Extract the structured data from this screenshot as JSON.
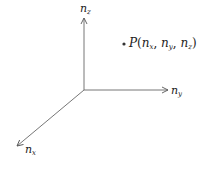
{
  "diagram": {
    "type": "3d-axes",
    "axes": {
      "z": {
        "base": "n",
        "sub": "z"
      },
      "y": {
        "base": "n",
        "sub": "y"
      },
      "x": {
        "base": "n",
        "sub": "x"
      }
    },
    "point": {
      "name": "P",
      "open": "(",
      "coords": [
        {
          "base": "n",
          "sub": "x"
        },
        {
          "base": "n",
          "sub": "y"
        },
        {
          "base": "n",
          "sub": "z"
        }
      ],
      "sep": ", ",
      "close": ")"
    },
    "colors": {
      "stroke": "#555555",
      "text": "#222222"
    }
  }
}
